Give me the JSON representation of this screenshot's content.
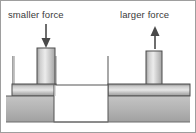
{
  "figure": {
    "width": 196,
    "height": 133,
    "background": "#ffffff",
    "border_color": "#9a9a9a"
  },
  "labels": {
    "left": {
      "text": "smaller force",
      "x": 8,
      "y": 18,
      "arrow_direction": "down",
      "arrow_name": "arrow-down-icon"
    },
    "right": {
      "text": "larger force",
      "x": 122,
      "y": 18,
      "arrow_direction": "up",
      "arrow_name": "arrow-up-icon"
    }
  },
  "arrows": {
    "color": "#4a4a4a",
    "left": {
      "x": 46,
      "y_top": 24,
      "y_bottom": 47
    },
    "right": {
      "x": 155,
      "y_top": 26,
      "y_bottom": 49
    }
  },
  "pistons": {
    "left": {
      "rod": {
        "x": 37,
        "y": 48,
        "width": 18,
        "height": 36
      },
      "plate": {
        "x": 12,
        "y": 84,
        "width": 44,
        "height": 12
      },
      "outline_color": "#4d4d4d"
    },
    "right": {
      "rod": {
        "x": 146,
        "y": 50,
        "width": 16,
        "height": 34
      },
      "plate": {
        "x": 108,
        "y": 84,
        "width": 82,
        "height": 12
      },
      "outline_color": "#4d4d4d"
    }
  },
  "vessel": {
    "body_fill_top": "#c9c9c9",
    "body_fill_bottom": "#9f9f9f",
    "left_block": {
      "x": 6,
      "y": 96,
      "width": 48,
      "height": 26
    },
    "right_block": {
      "x": 108,
      "y": 96,
      "width": 82,
      "height": 26
    },
    "cavity": {
      "x": 54,
      "y": 85,
      "width": 54,
      "height": 37,
      "fill": "#ffffff"
    },
    "walls": [
      {
        "name": "wall-left-outer",
        "x": 12,
        "y_top": 56,
        "y_bottom": 84
      },
      {
        "name": "wall-left-inner",
        "x": 55,
        "y_top": 56,
        "y_bottom": 84
      },
      {
        "name": "wall-right-inner",
        "x": 108,
        "y_top": 56,
        "y_bottom": 84
      }
    ],
    "wall_color": "#8c8c8c",
    "base_line_y": 122,
    "base_line_color": "#6e6e6e"
  },
  "colors": {
    "metal_light": "#e8e8e8",
    "metal_mid": "#b8b8b8",
    "metal_dark": "#8f8f8f",
    "text": "#3a3a3a",
    "outline": "#4d4d4d"
  }
}
